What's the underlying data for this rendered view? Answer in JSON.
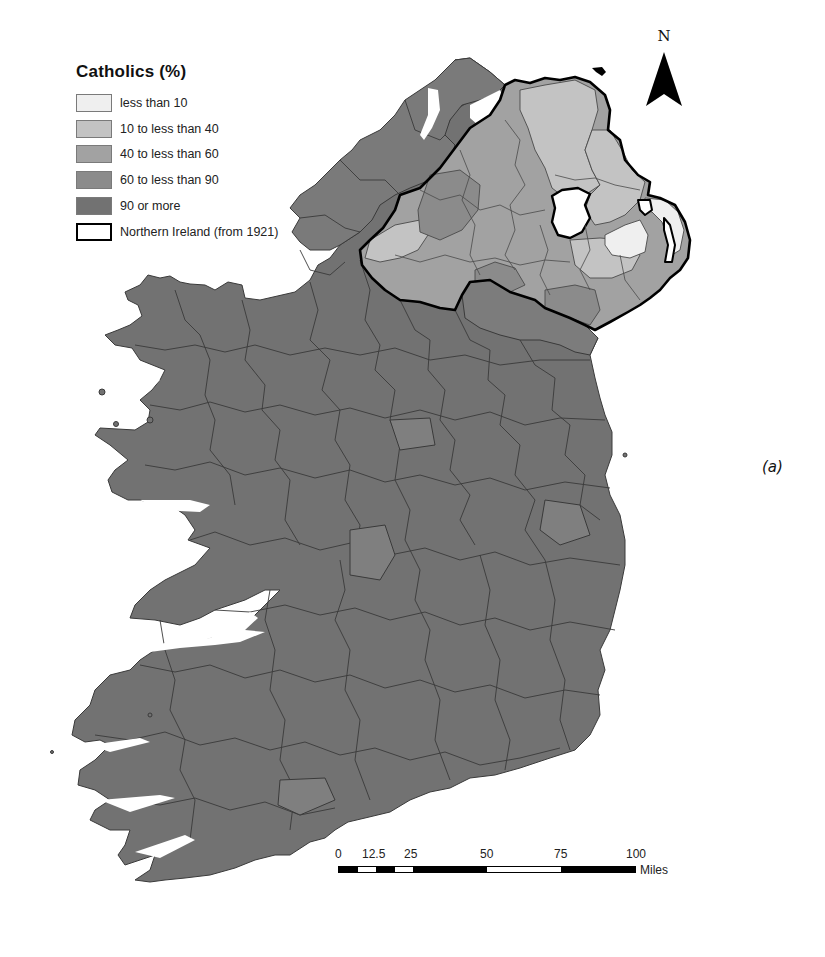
{
  "legend": {
    "title": "Catholics (%)",
    "items": [
      {
        "label": "less than 10",
        "color": "#efefef"
      },
      {
        "label": "10 to less than 40",
        "color": "#c3c3c3"
      },
      {
        "label": "40 to less than 60",
        "color": "#a2a2a2"
      },
      {
        "label": "60 to less than 90",
        "color": "#8b8b8b"
      },
      {
        "label": "90 or more",
        "color": "#727272"
      },
      {
        "label": "Northern Ireland (from 1921)",
        "color": "#ffffff",
        "outline": true
      }
    ]
  },
  "north_arrow": {
    "label": "N"
  },
  "scale_bar": {
    "ticks": [
      "0",
      "12.5",
      "25",
      "50",
      "75",
      "100"
    ],
    "unit": "Miles"
  },
  "panel_label": "(a)",
  "colors": {
    "ocean": "#ffffff",
    "boundary": "#333333",
    "ni_border": "#000000",
    "lough_neagh": "#ffffff"
  }
}
